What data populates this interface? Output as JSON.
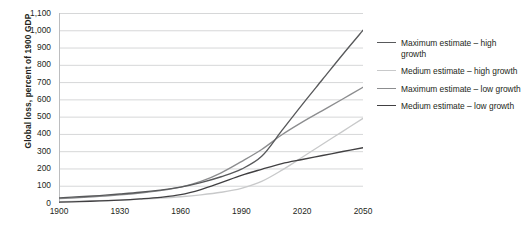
{
  "chart_data": {
    "type": "line",
    "title": "",
    "xlabel": "",
    "ylabel": "Global loss, percent of 1900 GDP",
    "xlim": [
      1900,
      2050
    ],
    "ylim": [
      0,
      1100
    ],
    "grid": true,
    "legend_position": "right",
    "x_ticks": [
      "1900",
      "1930",
      "1960",
      "1990",
      "2020",
      "2050"
    ],
    "x_tick_values": [
      1900,
      1930,
      1960,
      1990,
      2020,
      2050
    ],
    "y_ticks": [
      "0",
      "100",
      "200",
      "300",
      "400",
      "500",
      "600",
      "700",
      "800",
      "900",
      "1,000",
      "1,100"
    ],
    "y_tick_values": [
      0,
      100,
      200,
      300,
      400,
      500,
      600,
      700,
      800,
      900,
      1000,
      1100
    ],
    "x": [
      1900,
      1910,
      1920,
      1930,
      1940,
      1950,
      1960,
      1970,
      1980,
      1990,
      2000,
      2010,
      2020,
      2030,
      2040,
      2050
    ],
    "series": [
      {
        "name": "Maximum estimate – high growth",
        "color": "#58595b",
        "values": [
          30,
          36,
          43,
          52,
          62,
          75,
          92,
          118,
          152,
          196,
          270,
          420,
          570,
          715,
          860,
          1000
        ]
      },
      {
        "name": "Medium estimate – high growth",
        "color": "#c8c9ca",
        "values": [
          8,
          10,
          13,
          17,
          22,
          28,
          36,
          47,
          62,
          85,
          125,
          190,
          265,
          340,
          415,
          490
        ]
      },
      {
        "name": "Maximum estimate – low growth",
        "color": "#8c8d8f",
        "values": [
          25,
          31,
          38,
          47,
          58,
          72,
          92,
          125,
          175,
          240,
          310,
          395,
          468,
          535,
          602,
          670
        ]
      },
      {
        "name": "Medium estimate – low growth",
        "color": "#414042",
        "values": [
          5,
          8,
          12,
          17,
          24,
          33,
          48,
          78,
          118,
          160,
          195,
          228,
          252,
          275,
          298,
          320
        ]
      }
    ]
  },
  "legend": {
    "items": [
      {
        "label": "Maximum estimate – high growth",
        "color": "#58595b"
      },
      {
        "label": "Medium estimate – high growth",
        "color": "#c8c9ca"
      },
      {
        "label": "Maximum estimate – low growth",
        "color": "#8c8d8f"
      },
      {
        "label": "Medium estimate – low growth",
        "color": "#414042"
      }
    ]
  },
  "style": {
    "gridline_color": "#d6d7d8",
    "axis_color": "#bcbdbf",
    "text_color": "#231f20",
    "background": "#ffffff"
  }
}
